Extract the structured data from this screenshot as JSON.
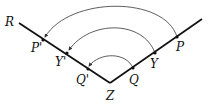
{
  "diagram": {
    "vertex": {
      "label": "Z",
      "x": 110,
      "y": 83,
      "lx": 106,
      "ly": 100
    },
    "ray_left_end": {
      "label": "R",
      "x": 19,
      "y": 23,
      "lx": 5,
      "ly": 26
    },
    "ray_right_end": {
      "x": 202,
      "y": 19
    },
    "points": [
      {
        "label": "P'",
        "x": 43,
        "y": 40,
        "lx": 31,
        "ly": 52
      },
      {
        "label": "Y'",
        "x": 67,
        "y": 53,
        "lx": 55,
        "ly": 66
      },
      {
        "label": "Q'",
        "x": 88,
        "y": 69,
        "lx": 76,
        "ly": 84
      },
      {
        "label": "Q",
        "x": 133,
        "y": 68,
        "lx": 129,
        "ly": 84
      },
      {
        "label": "Y",
        "x": 155,
        "y": 53,
        "lx": 150,
        "ly": 68
      },
      {
        "label": "P",
        "x": 177,
        "y": 37,
        "lx": 176,
        "ly": 51
      }
    ],
    "colors": {
      "line": "#111111",
      "arc": "#333333"
    }
  }
}
